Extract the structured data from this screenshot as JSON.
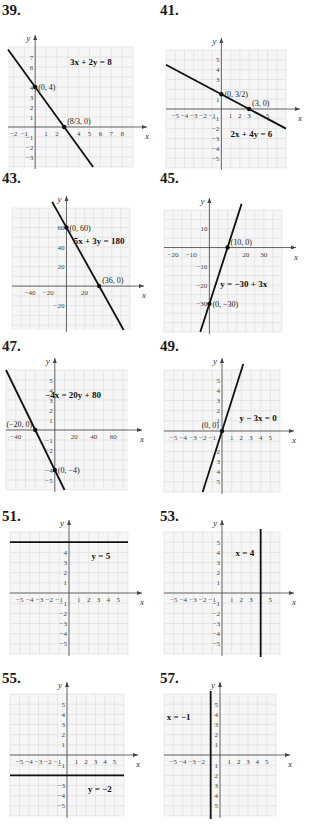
{
  "chart_data": [
    {
      "id": "39",
      "type": "line",
      "number": "39.",
      "equation": "3x + 2y = 8",
      "xlabel": "x",
      "ylabel": "y",
      "xlim": [
        -2.5,
        9
      ],
      "ylim": [
        -4,
        8
      ],
      "grid_step": 1,
      "xticks": [
        "-2",
        "-1",
        "1",
        "2",
        "4",
        "5",
        "6",
        "7",
        "8"
      ],
      "xtick_values": [
        -2,
        -1,
        1,
        2,
        4,
        5,
        6,
        7,
        8
      ],
      "yticks": [
        "7",
        "6",
        "4",
        "3",
        "2",
        "1",
        "-1",
        "-2",
        "-3"
      ],
      "ytick_values": [
        7,
        6,
        4,
        3,
        2,
        1,
        -1,
        -2,
        -3
      ],
      "line": {
        "slope": -1.5,
        "intercept": 4,
        "vertical_x": null
      },
      "points": [
        {
          "x": 0,
          "y": 4,
          "label": "(0, 4)"
        },
        {
          "x": 2.6667,
          "y": 0,
          "label": "(8/3, 0)"
        }
      ]
    },
    {
      "id": "41",
      "type": "line",
      "number": "41.",
      "equation": "2x + 4y = 6",
      "xlabel": "x",
      "ylabel": "y",
      "xlim": [
        -6,
        7
      ],
      "ylim": [
        -6,
        6
      ],
      "grid_step": 1,
      "xticks": [
        "-5",
        "-4",
        "-3",
        "-2",
        "-1",
        "1",
        "2",
        "3",
        "5"
      ],
      "xtick_values": [
        -5,
        -4,
        -3,
        -2,
        -1,
        1,
        2,
        3,
        5
      ],
      "yticks": [
        "5",
        "4",
        "3",
        "1",
        "-1",
        "-2",
        "-3",
        "-4",
        "-5"
      ],
      "ytick_values": [
        5,
        4,
        3,
        1,
        -1,
        -2,
        -3,
        -4,
        -5
      ],
      "line": {
        "slope": -0.5,
        "intercept": 1.5,
        "vertical_x": null
      },
      "points": [
        {
          "x": 0,
          "y": 1.5,
          "label": "(0, 3/2)"
        },
        {
          "x": 3,
          "y": 0,
          "label": "(3, 0)"
        }
      ]
    },
    {
      "id": "43",
      "type": "line",
      "number": "43.",
      "equation": "5x + 3y = 180",
      "xlabel": "x",
      "ylabel": "y",
      "xlim": [
        -60,
        70
      ],
      "ylim": [
        -45,
        80
      ],
      "grid_step": 10,
      "xticks": [
        "-40",
        "-20",
        "20"
      ],
      "xtick_values": [
        -40,
        -20,
        20
      ],
      "yticks": [
        "60",
        "40",
        "20",
        "-20"
      ],
      "ytick_values": [
        60,
        40,
        20,
        -20
      ],
      "line": {
        "slope": -1.6667,
        "intercept": 60,
        "vertical_x": null
      },
      "points": [
        {
          "x": 0,
          "y": 60,
          "label": "(0, 60)"
        },
        {
          "x": 36,
          "y": 0,
          "label": "(36, 0)"
        }
      ]
    },
    {
      "id": "45",
      "type": "line",
      "number": "45.",
      "equation": "y = -30 + 3x",
      "xlabel": "x",
      "ylabel": "y",
      "xlim": [
        -25,
        40
      ],
      "ylim": [
        -45,
        20
      ],
      "grid_step": 5,
      "xticks": [
        "-20",
        "-10",
        "20",
        "30"
      ],
      "xtick_values": [
        -20,
        -10,
        20,
        30
      ],
      "yticks": [
        "10",
        "-10",
        "-20",
        "-30"
      ],
      "ytick_values": [
        10,
        -10,
        -20,
        -30
      ],
      "line": {
        "slope": 3,
        "intercept": -30,
        "vertical_x": null
      },
      "points": [
        {
          "x": 10,
          "y": 0,
          "label": "(10, 0)"
        },
        {
          "x": 0,
          "y": -30,
          "label": "(0, -30)"
        }
      ]
    },
    {
      "id": "47",
      "type": "line",
      "number": "47.",
      "equation": "-4x = 20y + 80",
      "xlabel": "x",
      "ylabel": "y",
      "xlim": [
        -50,
        75
      ],
      "ylim": [
        -6,
        6
      ],
      "grid_step": "custom",
      "xticks": [
        "-40",
        "20",
        "40",
        "60"
      ],
      "xtick_values": [
        -40,
        20,
        40,
        60
      ],
      "yticks": [
        "5",
        "4",
        "3",
        "2",
        "1",
        "-1",
        "-2",
        "-4",
        "-5"
      ],
      "ytick_values": [
        5,
        4,
        3,
        2,
        1,
        -1,
        -2,
        -4,
        -5
      ],
      "line": {
        "slope": -0.2,
        "intercept": -4,
        "vertical_x": null
      },
      "points": [
        {
          "x": -20,
          "y": 0,
          "label": "(-20, 0)"
        },
        {
          "x": 0,
          "y": -4,
          "label": "(0, -4)"
        }
      ]
    },
    {
      "id": "49",
      "type": "line",
      "number": "49.",
      "equation": "y - 3x = 0",
      "xlabel": "x",
      "ylabel": "y",
      "xlim": [
        -6,
        6
      ],
      "ylim": [
        -6,
        6
      ],
      "grid_step": 1,
      "xticks": [
        "-5",
        "-4",
        "-3",
        "-2",
        "-1",
        "1",
        "2",
        "3",
        "4",
        "5"
      ],
      "xtick_values": [
        -5,
        -4,
        -3,
        -2,
        -1,
        1,
        2,
        3,
        4,
        5
      ],
      "yticks": [
        "5",
        "4",
        "3",
        "2",
        "1",
        "2",
        "3",
        "4",
        "5"
      ],
      "ytick_values": [
        5,
        4,
        3,
        2,
        1,
        -2,
        -3,
        -4,
        -5
      ],
      "line": {
        "slope": 3,
        "intercept": 0,
        "vertical_x": null
      },
      "points": [
        {
          "x": 0,
          "y": 0,
          "label": "(0, 0)"
        }
      ]
    },
    {
      "id": "51",
      "type": "line",
      "number": "51.",
      "equation": "y = 5",
      "xlabel": "x",
      "ylabel": "y",
      "xlim": [
        -6,
        6
      ],
      "ylim": [
        -6,
        6
      ],
      "grid_step": 1,
      "xticks": [
        "-5",
        "-4",
        "-3",
        "-2",
        "-1",
        "1",
        "2",
        "3",
        "4",
        "5"
      ],
      "xtick_values": [
        -5,
        -4,
        -3,
        -2,
        -1,
        1,
        2,
        3,
        4,
        5
      ],
      "yticks": [
        "4",
        "3",
        "2",
        "1",
        "-1",
        "-2",
        "-3",
        "-4",
        "-5"
      ],
      "ytick_values": [
        4,
        3,
        2,
        1,
        -1,
        -2,
        -3,
        -4,
        -5
      ],
      "line": {
        "slope": 0,
        "intercept": 5,
        "vertical_x": null
      },
      "points": []
    },
    {
      "id": "53",
      "type": "line",
      "number": "53.",
      "equation": "x = 4",
      "xlabel": "x",
      "ylabel": "y",
      "xlim": [
        -6,
        6
      ],
      "ylim": [
        -6,
        6
      ],
      "grid_step": 1,
      "xticks": [
        "-5",
        "-4",
        "-3",
        "-2",
        "-1",
        "1",
        "2",
        "3",
        "5"
      ],
      "xtick_values": [
        -5,
        -4,
        -3,
        -2,
        -1,
        1,
        2,
        3,
        5
      ],
      "yticks": [
        "5",
        "4",
        "3",
        "2",
        "1",
        "-1",
        "-2",
        "-3",
        "-4",
        "-5"
      ],
      "ytick_values": [
        5,
        4,
        3,
        2,
        1,
        -1,
        -2,
        -3,
        -4,
        -5
      ],
      "line": {
        "slope": null,
        "intercept": null,
        "vertical_x": 4
      },
      "points": []
    },
    {
      "id": "55",
      "type": "line",
      "number": "55.",
      "equation": "y = -2",
      "xlabel": "x",
      "ylabel": "y",
      "xlim": [
        -6,
        6
      ],
      "ylim": [
        -6,
        6
      ],
      "grid_step": 1,
      "xticks": [
        "-5",
        "-4",
        "-3",
        "-2",
        "-1",
        "1",
        "2",
        "3",
        "4",
        "5"
      ],
      "xtick_values": [
        -5,
        -4,
        -3,
        -2,
        -1,
        1,
        2,
        3,
        4,
        5
      ],
      "yticks": [
        "5",
        "4",
        "3",
        "2",
        "1",
        "-1",
        "-3",
        "-4",
        "-5"
      ],
      "ytick_values": [
        5,
        4,
        3,
        2,
        1,
        -1,
        -3,
        -4,
        -5
      ],
      "line": {
        "slope": 0,
        "intercept": -2,
        "vertical_x": null
      },
      "points": []
    },
    {
      "id": "57",
      "type": "line",
      "number": "57.",
      "equation": "x = -1",
      "xlabel": "x",
      "ylabel": "y",
      "xlim": [
        -6,
        6
      ],
      "ylim": [
        -6,
        6
      ],
      "grid_step": 1,
      "xticks": [
        "-5",
        "-4",
        "-3",
        "-2",
        "1",
        "2",
        "3",
        "4",
        "5"
      ],
      "xtick_values": [
        -5,
        -4,
        -3,
        -2,
        1,
        2,
        3,
        4,
        5
      ],
      "yticks": [
        "5",
        "4",
        "3",
        "2",
        "1",
        "1",
        "2",
        "3",
        "4",
        "5"
      ],
      "ytick_values": [
        5,
        4,
        3,
        2,
        1,
        -1,
        -2,
        -3,
        -4,
        -5
      ],
      "line": {
        "slope": null,
        "intercept": null,
        "vertical_x": -1
      },
      "points": []
    }
  ]
}
